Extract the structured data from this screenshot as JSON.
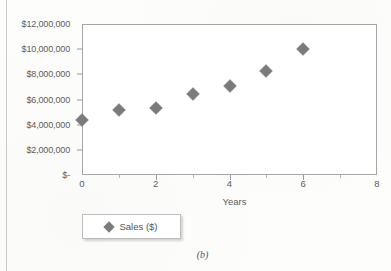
{
  "figure": {
    "caption": "(b)",
    "marker_color": "#7b7b7b",
    "frame_color": "#a6a6a4",
    "text_color": "#5c5c5a",
    "background": "#ffffff"
  },
  "legend": {
    "position": "below-plot-left",
    "entries": [
      {
        "label": "Sales ($)",
        "marker": "diamond",
        "color": "#7b7b7b"
      }
    ]
  },
  "chart_data": {
    "type": "scatter",
    "title": "",
    "xlabel": "Years",
    "ylabel": "",
    "xlim": [
      0,
      8
    ],
    "ylim": [
      0,
      12000000
    ],
    "grid": false,
    "legend_position": "bottom-left",
    "x_tick_labels": [
      "0",
      "2",
      "4",
      "6",
      "8"
    ],
    "x_tick_values": [
      0,
      2,
      4,
      6,
      8
    ],
    "x_minor_tick_values": [
      1,
      3,
      5,
      7
    ],
    "y_tick_labels": [
      "$12,000,000",
      "$10,000,000",
      "$8,000,000",
      "$6,000,000",
      "$4,000,000",
      "$2,000,000",
      "$-"
    ],
    "y_tick_values": [
      12000000,
      10000000,
      8000000,
      6000000,
      4000000,
      2000000,
      0
    ],
    "series": [
      {
        "name": "Sales ($)",
        "marker": "diamond",
        "color": "#7b7b7b",
        "x": [
          0,
          1,
          2,
          3,
          4,
          5,
          6
        ],
        "values": [
          4400000,
          5200000,
          5350000,
          6400000,
          7100000,
          8300000,
          10000000
        ]
      }
    ]
  }
}
